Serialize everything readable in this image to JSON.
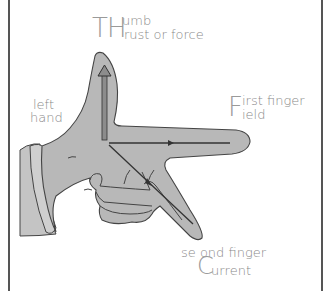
{
  "diagram": {
    "colors": {
      "hand_fill": "#b8b8b8",
      "outline": "#444444",
      "label_text": "#8a8a8a",
      "border": "#555555"
    },
    "labels": {
      "thumb": {
        "initials": "TH",
        "line1": "umb",
        "line2": "rust or force"
      },
      "hand": {
        "line1": "left",
        "line2": "hand"
      },
      "first_finger": {
        "initial": "F",
        "line1": "irst finger",
        "line2": "ield"
      },
      "second_finger": {
        "line1": "se ond finger",
        "initial": "C",
        "line2": "urrent"
      }
    },
    "arrows": [
      {
        "name": "thrust-arrow",
        "direction": "up",
        "style": "hollow"
      },
      {
        "name": "field-arrow",
        "direction": "right",
        "style": "line"
      },
      {
        "name": "current-arrow",
        "direction": "down-right",
        "style": "line"
      }
    ]
  }
}
